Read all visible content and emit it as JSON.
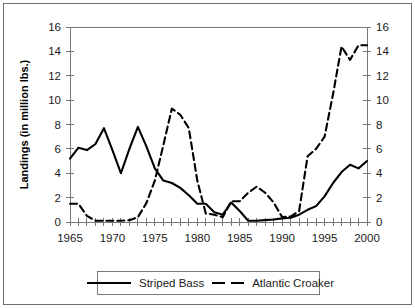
{
  "chart_data": {
    "type": "line",
    "title": "",
    "xlabel": "",
    "ylabel": "Landings (in million lbs.)",
    "ylabel_right": "",
    "xlim": [
      1965,
      2000
    ],
    "ylim": [
      0,
      16
    ],
    "ylim_right": [
      0,
      16
    ],
    "ytick_values": [
      0,
      2,
      4,
      6,
      8,
      10,
      12,
      14,
      16
    ],
    "ytick_labels": [
      "0",
      "2",
      "4",
      "6",
      "8",
      "10",
      "12",
      "14",
      "16"
    ],
    "ytick_right_labels": [
      "0",
      "2",
      "4",
      "6",
      "8",
      "10",
      "12",
      "14",
      "16"
    ],
    "xtick_values": [
      1965,
      1970,
      1975,
      1980,
      1985,
      1990,
      1995,
      2000
    ],
    "xtick_labels": [
      "1965",
      "1970",
      "1975",
      "1980",
      "1985",
      "1990",
      "1995",
      "2000"
    ],
    "xtick_minor_step": 1,
    "grid": false,
    "legend_position": "bottom-center",
    "series": [
      {
        "name": "Striped Bass",
        "style": "solid",
        "color": "#000000",
        "x": [
          1965,
          1966,
          1967,
          1968,
          1969,
          1970,
          1971,
          1972,
          1973,
          1974,
          1975,
          1976,
          1977,
          1978,
          1979,
          1980,
          1981,
          1982,
          1983,
          1984,
          1985,
          1986,
          1987,
          1988,
          1989,
          1990,
          1991,
          1992,
          1993,
          1994,
          1995,
          1996,
          1997,
          1998,
          1999,
          2000
        ],
        "values": [
          5.2,
          6.1,
          5.9,
          6.4,
          7.7,
          5.9,
          4.0,
          6.0,
          7.8,
          6.2,
          4.4,
          3.4,
          3.2,
          2.8,
          2.2,
          1.5,
          1.5,
          0.8,
          0.6,
          1.6,
          0.9,
          0.1,
          0.1,
          0.15,
          0.2,
          0.3,
          0.35,
          0.6,
          1.0,
          1.3,
          2.1,
          3.2,
          4.1,
          4.7,
          4.4,
          5.0
        ]
      },
      {
        "name": "Atlantic Croaker",
        "style": "dashed",
        "color": "#000000",
        "x": [
          1965,
          1966,
          1967,
          1968,
          1969,
          1970,
          1971,
          1972,
          1973,
          1974,
          1975,
          1976,
          1977,
          1978,
          1979,
          1980,
          1981,
          1982,
          1983,
          1984,
          1985,
          1986,
          1987,
          1988,
          1989,
          1990,
          1991,
          1992,
          1993,
          1994,
          1995,
          1996,
          1997,
          1998,
          1999,
          2000
        ],
        "values": [
          1.5,
          1.5,
          0.5,
          0.1,
          0.1,
          0.1,
          0.1,
          0.15,
          0.4,
          1.55,
          3.4,
          6.3,
          9.3,
          8.8,
          7.7,
          3.4,
          0.7,
          0.6,
          0.4,
          1.7,
          1.7,
          2.4,
          2.9,
          2.4,
          1.6,
          0.4,
          0.45,
          0.9,
          5.4,
          6.0,
          7.0,
          10.5,
          14.4,
          13.3,
          14.5,
          14.5
        ]
      }
    ]
  },
  "legend": {
    "entries": [
      {
        "label": "Striped Bass",
        "style": "solid"
      },
      {
        "label": "Atlantic Croaker",
        "style": "dashed"
      }
    ]
  }
}
